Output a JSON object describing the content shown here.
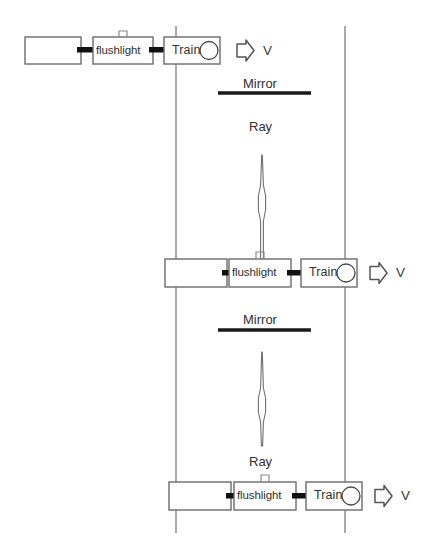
{
  "diagram": {
    "canvas": {
      "width": 432,
      "height": 554
    },
    "colors": {
      "background": "#ffffff",
      "box_stroke": "#6b6b6b",
      "coupler": "#111111",
      "mirror": "#1a1a1a",
      "rail": "#7d7d7d",
      "ray_stroke": "#6f6f6f",
      "text": "#2f2f2f"
    },
    "reference_lines": [
      {
        "name": "left-reference-line",
        "x": 176
      },
      {
        "name": "right-reference-line",
        "x": 345
      }
    ],
    "assemblies": [
      {
        "id": "top",
        "cargo_car_label": "",
        "flushlight_label": "flushlight",
        "train_label": "Train",
        "velocity_label": "V",
        "arrow_icon": "right-arrow-icon",
        "lamp_icon": "lamp-notch-icon",
        "wheel_icon": "wheel-circle-icon"
      },
      {
        "id": "middle",
        "cargo_car_label": "",
        "flushlight_label": "flushlight",
        "train_label": "Train",
        "velocity_label": "V",
        "arrow_icon": "right-arrow-icon",
        "lamp_icon": "lamp-notch-icon",
        "wheel_icon": "wheel-circle-icon"
      },
      {
        "id": "bottom",
        "cargo_car_label": "",
        "flushlight_label": "flushlight",
        "train_label": "Train",
        "velocity_label": "V",
        "arrow_icon": "right-arrow-icon",
        "lamp_icon": "lamp-notch-icon",
        "wheel_icon": "wheel-circle-icon"
      }
    ],
    "mirrors": [
      {
        "id": "mirror-upper",
        "label": "Mirror"
      },
      {
        "id": "mirror-lower",
        "label": "Mirror"
      }
    ],
    "rays": [
      {
        "id": "ray-upper",
        "label": "Ray",
        "label_position": "above"
      },
      {
        "id": "ray-lower",
        "label": "Ray",
        "label_position": "below"
      }
    ]
  }
}
